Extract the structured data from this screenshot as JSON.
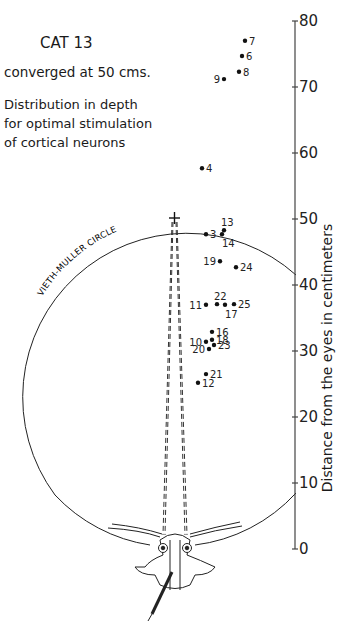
{
  "header": {
    "title": "CAT 13",
    "subtitle": "converged at 50 cms.",
    "description": [
      "Distribution in depth",
      "for optimal stimulation",
      "of cortical neurons"
    ]
  },
  "circle_label": "VIETH-MULLER CIRCLE",
  "chart_data": {
    "type": "scatter",
    "title": "CAT 13",
    "subtitle": "converged at 50 cms. Distribution in depth for optimal stimulation of cortical neurons",
    "xlabel": "",
    "ylabel": "Distance from the eyes in centimeters",
    "ylim": [
      0,
      80
    ],
    "yticks": [
      0,
      10,
      20,
      30,
      40,
      50,
      60,
      70,
      80
    ],
    "grid": false,
    "fixation_point_cm": 50,
    "annotations": [
      "VIETH-MULLER CIRCLE"
    ],
    "points": [
      {
        "label": "7",
        "x_offset": 69,
        "y": 77.0
      },
      {
        "label": "6",
        "x_offset": 66,
        "y": 74.7
      },
      {
        "label": "8",
        "x_offset": 63,
        "y": 72.3
      },
      {
        "label": "9",
        "x_offset": 48,
        "y": 71.2
      },
      {
        "label": "4",
        "x_offset": 26,
        "y": 57.7
      },
      {
        "label": "13",
        "x_offset": 48,
        "y": 48.3
      },
      {
        "label": "14",
        "x_offset": 46,
        "y": 47.7
      },
      {
        "label": "3",
        "x_offset": 30,
        "y": 47.7
      },
      {
        "label": "19",
        "x_offset": 44,
        "y": 43.6
      },
      {
        "label": "24",
        "x_offset": 60,
        "y": 42.7
      },
      {
        "label": "11",
        "x_offset": 30,
        "y": 37.0
      },
      {
        "label": "22",
        "x_offset": 41,
        "y": 37.1
      },
      {
        "label": "17",
        "x_offset": 49,
        "y": 37.0
      },
      {
        "label": "25",
        "x_offset": 58,
        "y": 37.1
      },
      {
        "label": "16",
        "x_offset": 36,
        "y": 32.9
      },
      {
        "label": "18",
        "x_offset": 36,
        "y": 31.7
      },
      {
        "label": "10",
        "x_offset": 30,
        "y": 31.4
      },
      {
        "label": "23",
        "x_offset": 38,
        "y": 30.9
      },
      {
        "label": "20",
        "x_offset": 33,
        "y": 30.3
      },
      {
        "label": "21",
        "x_offset": 30,
        "y": 26.5
      },
      {
        "label": "12",
        "x_offset": 22,
        "y": 25.2
      }
    ]
  }
}
